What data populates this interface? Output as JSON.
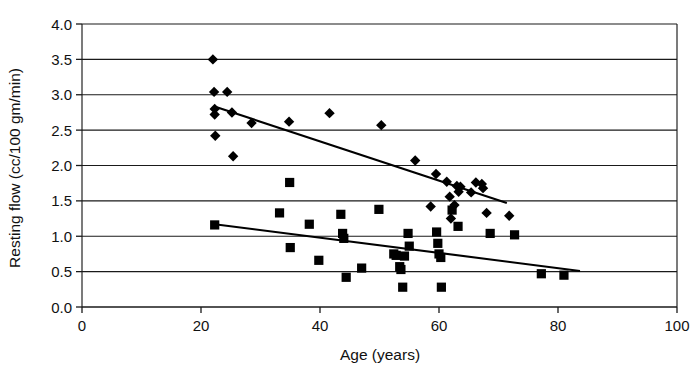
{
  "chart_data": {
    "type": "scatter",
    "title": "",
    "xlabel": "Age (years)",
    "ylabel": "Resting flow (cc/100 gm/min)",
    "xlim": [
      0,
      100
    ],
    "ylim": [
      0,
      4.0
    ],
    "xticks": [
      0,
      20,
      40,
      60,
      80,
      100
    ],
    "xtick_labels": [
      "0",
      "20",
      "40",
      "60",
      "80",
      "100"
    ],
    "yticks": [
      0.0,
      0.5,
      1.0,
      1.5,
      2.0,
      2.5,
      3.0,
      3.5,
      4.0
    ],
    "ytick_labels": [
      "0.0",
      "0.5",
      "1.0",
      "1.5",
      "2.0",
      "2.5",
      "3.0",
      "3.5",
      "4.0"
    ],
    "grid": "horizontal",
    "legend": "none",
    "series": [
      {
        "name": "diamond-series",
        "marker": "diamond",
        "color": "#000000",
        "points": [
          [
            22.0,
            3.5
          ],
          [
            22.2,
            3.04
          ],
          [
            24.4,
            3.04
          ],
          [
            22.3,
            2.8
          ],
          [
            22.3,
            2.72
          ],
          [
            25.2,
            2.75
          ],
          [
            22.4,
            2.42
          ],
          [
            25.4,
            2.13
          ],
          [
            28.5,
            2.6
          ],
          [
            34.8,
            2.62
          ],
          [
            41.6,
            2.74
          ],
          [
            50.3,
            2.57
          ],
          [
            56.0,
            2.07
          ],
          [
            59.5,
            1.88
          ],
          [
            61.3,
            1.77
          ],
          [
            63.0,
            1.71
          ],
          [
            63.6,
            1.7
          ],
          [
            66.2,
            1.76
          ],
          [
            67.2,
            1.74
          ],
          [
            67.4,
            1.68
          ],
          [
            61.8,
            1.56
          ],
          [
            63.3,
            1.63
          ],
          [
            65.4,
            1.62
          ],
          [
            58.6,
            1.42
          ],
          [
            62.6,
            1.44
          ],
          [
            62.0,
            1.25
          ],
          [
            68.0,
            1.33
          ],
          [
            71.8,
            1.29
          ]
        ]
      },
      {
        "name": "square-series",
        "marker": "square",
        "color": "#000000",
        "points": [
          [
            22.3,
            1.16
          ],
          [
            34.9,
            1.76
          ],
          [
            33.2,
            1.33
          ],
          [
            35.0,
            0.84
          ],
          [
            38.2,
            1.17
          ],
          [
            39.8,
            0.66
          ],
          [
            43.5,
            1.31
          ],
          [
            43.8,
            1.04
          ],
          [
            44.0,
            0.97
          ],
          [
            44.4,
            0.42
          ],
          [
            47.0,
            0.55
          ],
          [
            49.9,
            1.38
          ],
          [
            52.4,
            0.75
          ],
          [
            52.8,
            0.73
          ],
          [
            53.4,
            0.57
          ],
          [
            53.6,
            0.53
          ],
          [
            54.2,
            0.72
          ],
          [
            53.9,
            0.28
          ],
          [
            54.8,
            1.04
          ],
          [
            55.0,
            0.86
          ],
          [
            59.6,
            1.06
          ],
          [
            59.8,
            0.9
          ],
          [
            60.0,
            0.75
          ],
          [
            60.3,
            0.7
          ],
          [
            60.4,
            0.28
          ],
          [
            62.2,
            1.37
          ],
          [
            63.2,
            1.14
          ],
          [
            68.6,
            1.04
          ],
          [
            72.7,
            1.02
          ],
          [
            77.2,
            0.47
          ],
          [
            81.0,
            0.45
          ]
        ]
      }
    ],
    "trendlines": [
      {
        "name": "diamond-trendline",
        "series": "diamond-series",
        "x_start": 22.4,
        "y_start": 2.83,
        "x_end": 71.4,
        "y_end": 1.47
      },
      {
        "name": "square-trendline",
        "series": "square-series",
        "x_start": 22.3,
        "y_start": 1.17,
        "x_end": 83.7,
        "y_end": 0.51
      }
    ]
  }
}
